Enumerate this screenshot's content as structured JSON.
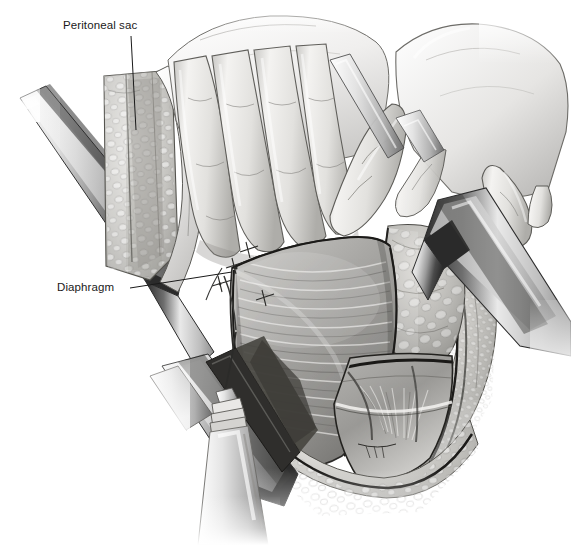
{
  "figure": {
    "background_color": "#ffffff",
    "width": 571,
    "height": 545,
    "style": "grayscale medical pen-and-ink / airbrush rendering"
  },
  "labels": [
    {
      "id": "peritoneal-sac",
      "text": "Peritoneal sac",
      "x": 63,
      "y": 19,
      "leader": {
        "from_x": 131,
        "from_y": 36,
        "to_x": 136,
        "to_y": 130
      }
    },
    {
      "id": "diaphragm",
      "text": "Diaphragm",
      "x": 57,
      "y": 281,
      "leader": {
        "from_x": 130,
        "from_y": 288,
        "to_x": 232,
        "to_y": 272
      }
    }
  ],
  "anatomy": [
    {
      "name": "peritoneal-sac",
      "description": "pale fatty peritoneal sac column at upper left of the wound"
    },
    {
      "name": "subcutaneous-fat",
      "description": "lobular adipose tissue lining the wound edges"
    },
    {
      "name": "diaphragm",
      "description": "central fan of radiating diaphragmatic muscle fibers"
    },
    {
      "name": "fat-pad",
      "description": "coarse lobular fat pad right of the diaphragm"
    },
    {
      "name": "intercostal-muscle",
      "description": "deep intercostal muscle and vessels in lower right of wound"
    },
    {
      "name": "wound-edge",
      "description": "dark incision margin outlining the exposure"
    }
  ],
  "instruments": [
    {
      "name": "left-retractor-blade",
      "description": "broad metal retractor blade entering from upper left, angled down-right"
    },
    {
      "name": "right-retractor-blade",
      "description": "metal retractor blade held by the right hand at the right wound margin"
    },
    {
      "name": "lower-retractor-blade",
      "description": "retractor blade crossing the lower wound from left"
    },
    {
      "name": "hemostat-clamp",
      "description": "ridged-jaw hemostat at lower left grasping a traction suture"
    },
    {
      "name": "traction-suture",
      "description": "fine suture running from the diaphragm edge to the hemostat"
    },
    {
      "name": "interrupted-sutures",
      "description": "row of small interrupted stitches along the left diaphragm edge"
    }
  ],
  "hands": [
    {
      "name": "left-hand",
      "description": "surgeon's left hand, four fingers flexed, depressing the viscera"
    },
    {
      "name": "right-hand",
      "description": "surgeon's right hand, index finger extended and pointing down, thumb gripping the right retractor"
    }
  ],
  "palette": {
    "ink": "#1a1a1a",
    "wound_edge": "#111111",
    "tissue_light": "#ececec",
    "tissue_mid": "#b9b9b9",
    "tissue_dark": "#8a8a8a",
    "metal_light": "#f2f2f2",
    "metal_dark": "#3a3a3a",
    "skin_light": "#f6f6f6",
    "skin_mid": "#d8d8d8",
    "background": "#ffffff"
  }
}
